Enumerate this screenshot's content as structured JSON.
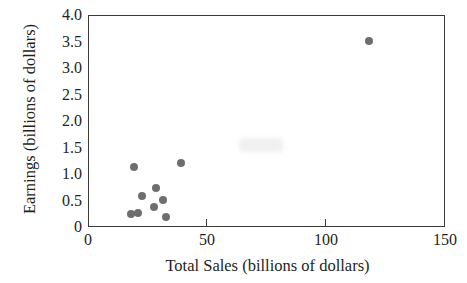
{
  "chart_data": {
    "type": "scatter",
    "title": "",
    "xlabel": "Total Sales (billions of dollars)",
    "ylabel": "Earnings (billions of dollars)",
    "xlim": [
      0,
      150
    ],
    "ylim": [
      0,
      4.0
    ],
    "xticks": [
      0,
      50,
      100,
      150
    ],
    "xtick_labels": [
      "0",
      "50",
      "100",
      "150"
    ],
    "yticks": [
      0,
      0.5,
      1.0,
      1.5,
      2.0,
      2.5,
      3.0,
      3.5,
      4.0
    ],
    "ytick_labels": [
      "0",
      "0.5",
      "1.0",
      "1.5",
      "2.0",
      "2.5",
      "3.0",
      "3.5",
      "4.0"
    ],
    "grid": false,
    "legend": null,
    "marker": {
      "shape": "circle",
      "color": "#6d6e70",
      "size_px": 8
    },
    "series": [
      {
        "name": "Companies",
        "points": [
          {
            "x": 17.7,
            "y": 0.27
          },
          {
            "x": 20.7,
            "y": 0.28
          },
          {
            "x": 18.9,
            "y": 1.15
          },
          {
            "x": 22.1,
            "y": 0.6
          },
          {
            "x": 27.3,
            "y": 0.4
          },
          {
            "x": 28.0,
            "y": 0.75
          },
          {
            "x": 31.3,
            "y": 0.53
          },
          {
            "x": 32.4,
            "y": 0.21
          },
          {
            "x": 38.7,
            "y": 1.23
          },
          {
            "x": 117.6,
            "y": 3.53
          }
        ]
      }
    ]
  },
  "figure": {
    "background": "#ffffff",
    "axis_color": "#3a3a3c",
    "text_color": "#231f20"
  }
}
